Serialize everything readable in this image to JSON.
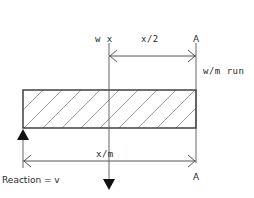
{
  "diagram": {
    "type": "beam-loading-diagram",
    "labels": {
      "load_point": "w x",
      "half_dimension": "x/2",
      "section_top": "A",
      "distributed_load": "w/m run",
      "span_dimension": "x/m",
      "section_bottom": "A",
      "reaction": "Reaction = v"
    },
    "colors": {
      "line": "#555555",
      "beam_outline": "#333333",
      "hatch": "#777777",
      "arrow_fill": "#111111",
      "text": "#2a2a2a"
    }
  }
}
